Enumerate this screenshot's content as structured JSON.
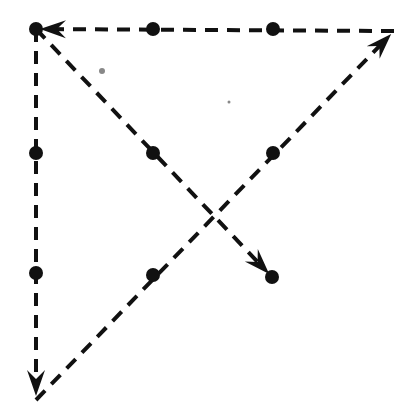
{
  "diagram": {
    "type": "nine-dot-puzzle-solution",
    "colors": {
      "ink": "#111111",
      "background": "#ffffff",
      "speck": "#888888"
    },
    "dots": [
      {
        "x": 36,
        "y": 29
      },
      {
        "x": 153,
        "y": 29
      },
      {
        "x": 273,
        "y": 29
      },
      {
        "x": 36,
        "y": 153
      },
      {
        "x": 153,
        "y": 153
      },
      {
        "x": 273,
        "y": 153
      },
      {
        "x": 36,
        "y": 273
      },
      {
        "x": 153,
        "y": 275
      },
      {
        "x": 272,
        "y": 277
      }
    ],
    "path": [
      {
        "from": [
          36,
          29
        ],
        "to": [
          36,
          400
        ],
        "arrow_at_end": true
      },
      {
        "from": [
          36,
          400
        ],
        "to": [
          394,
          31
        ],
        "arrow_at_end": true
      },
      {
        "from": [
          394,
          31
        ],
        "to": [
          36,
          29
        ],
        "arrow_at_end": true
      },
      {
        "from": [
          36,
          29
        ],
        "to": [
          272,
          277
        ],
        "arrow_at_end": true
      }
    ],
    "specks": [
      {
        "x": 102,
        "y": 71,
        "r": 3
      },
      {
        "x": 229,
        "y": 102,
        "r": 1.5
      }
    ]
  }
}
